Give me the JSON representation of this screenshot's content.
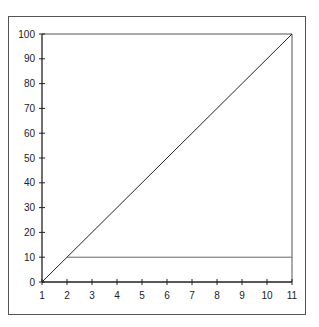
{
  "chart_data": {
    "type": "line",
    "title": "",
    "xlabel": "",
    "ylabel": "",
    "xlim": [
      1,
      11
    ],
    "ylim": [
      0,
      100
    ],
    "x_ticks": [
      "1",
      "2",
      "3",
      "4",
      "5",
      "6",
      "7",
      "8",
      "9",
      "10",
      "11"
    ],
    "y_ticks": [
      "0",
      "10",
      "20",
      "30",
      "40",
      "50",
      "60",
      "70",
      "80",
      "90",
      "100"
    ],
    "grid": false,
    "legend": null,
    "series": [
      {
        "name": "diagonal",
        "x": [
          1,
          11
        ],
        "y": [
          0,
          100
        ],
        "color": "#222222"
      },
      {
        "name": "horizontal",
        "x": [
          2,
          11
        ],
        "y": [
          10,
          10
        ],
        "color": "#666666"
      }
    ]
  }
}
